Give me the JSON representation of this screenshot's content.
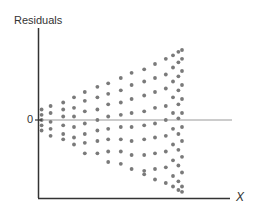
{
  "chart_data": {
    "type": "scatter",
    "title": "",
    "xlabel": "X",
    "ylabel": "Residuals",
    "y_tick_labels": [
      "0"
    ],
    "reference_line": {
      "y": 0,
      "label": "0"
    },
    "grid": false,
    "legend": null,
    "pattern": "fan-shaped (heteroscedastic) residuals: spread increases with X",
    "xlim": [
      0,
      10
    ],
    "ylim": [
      -4.5,
      4.5
    ],
    "columns": [
      {
        "x": 0.2,
        "y": [
          0.6,
          0.3,
          0.0,
          -0.3,
          -0.6
        ]
      },
      {
        "x": 0.7,
        "y": [
          0.8,
          0.4,
          -0.1,
          -0.5,
          -0.9
        ]
      },
      {
        "x": 1.4,
        "y": [
          1.0,
          0.6,
          0.2,
          -0.3,
          -0.8,
          -1.1
        ]
      },
      {
        "x": 2.0,
        "y": [
          1.3,
          0.7,
          0.2,
          -0.4,
          -1.0,
          -1.4
        ]
      },
      {
        "x": 2.6,
        "y": [
          1.6,
          1.1,
          0.5,
          -0.2,
          -0.8,
          -1.3,
          -1.9
        ]
      },
      {
        "x": 3.3,
        "y": [
          1.9,
          1.3,
          0.6,
          0.0,
          -0.6,
          -1.2,
          -1.9
        ]
      },
      {
        "x": 3.9,
        "y": [
          2.1,
          1.5,
          0.9,
          0.2,
          -0.5,
          -1.1,
          -1.8,
          -2.4
        ]
      },
      {
        "x": 4.6,
        "y": [
          2.4,
          1.7,
          1.0,
          0.3,
          -0.4,
          -1.1,
          -1.8,
          -2.5
        ]
      },
      {
        "x": 5.2,
        "y": [
          2.7,
          2.0,
          1.2,
          0.4,
          -0.4,
          -1.2,
          -2.0,
          -2.8
        ]
      },
      {
        "x": 5.9,
        "y": [
          2.9,
          2.2,
          1.4,
          0.5,
          -0.3,
          -1.1,
          -2.0,
          -2.9,
          -3.1
        ]
      },
      {
        "x": 6.5,
        "y": [
          3.2,
          2.4,
          1.6,
          0.7,
          -0.2,
          -1.0,
          -1.9,
          -2.8,
          -3.4
        ]
      },
      {
        "x": 7.1,
        "y": [
          3.5,
          2.6,
          1.8,
          0.8,
          0.0,
          -0.9,
          -1.8,
          -2.7,
          -3.6
        ]
      },
      {
        "x": 7.5,
        "y": [
          3.7,
          3.0,
          2.2,
          1.3,
          0.4,
          -0.5,
          -1.4,
          -2.3,
          -3.2,
          -3.8
        ]
      },
      {
        "x": 7.8,
        "y": [
          3.9,
          3.3,
          2.5,
          1.7,
          0.9,
          0.1,
          -0.8,
          -1.7,
          -2.6,
          -3.5,
          -4.0
        ]
      },
      {
        "x": 8.0,
        "y": [
          4.0,
          3.5,
          2.8,
          2.0,
          1.2,
          0.4,
          -0.4,
          -1.2,
          -2.1,
          -3.0,
          -3.8,
          -4.1
        ]
      }
    ]
  },
  "labels": {
    "ylabel": "Residuals",
    "zero": "0",
    "xlabel": "X"
  },
  "colors": {
    "axis": "#333333",
    "zero_line": "#9a9a9a",
    "dot": "#7a7a7a"
  }
}
